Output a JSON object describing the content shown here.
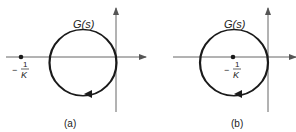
{
  "figure": {
    "panels": [
      {
        "id": "a",
        "caption": "(a)",
        "curve_label": "G(s)",
        "point_label_minus": "−",
        "point_label_num": "1",
        "point_label_den": "K",
        "point_position": "outside contour, left of curve"
      },
      {
        "id": "b",
        "caption": "(b)",
        "curve_label": "G(s)",
        "point_label_minus": "−",
        "point_label_num": "1",
        "point_label_den": "K",
        "point_position": "inside contour"
      }
    ],
    "colors": {
      "axis": "#555555",
      "curve": "#1a1a1a",
      "text": "#222222"
    }
  }
}
